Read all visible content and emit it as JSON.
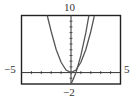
{
  "chart_data": {
    "type": "line",
    "title": "",
    "xlabel": "",
    "ylabel": "",
    "xlim": [
      -5,
      5
    ],
    "ylim": [
      -2,
      10
    ],
    "grid": false,
    "x_ticks_every": 1,
    "y_ticks_every": 1,
    "window_labels": {
      "xmin": "−5",
      "xmax": "5",
      "ymin": "−2",
      "ymax": "10"
    },
    "series": [
      {
        "name": "curve-1",
        "description": "wide parabola, vertex at origin",
        "x": [
          -2.4,
          -2,
          -1.5,
          -1,
          -0.5,
          0,
          0.5,
          1,
          1.5,
          2,
          2.35
        ],
        "y": [
          10,
          7.2,
          4.05,
          1.8,
          0.45,
          0,
          0.45,
          1.8,
          4.05,
          7.2,
          9.9
        ]
      },
      {
        "name": "curve-2",
        "description": "steeper curve rising from below y=-2 near x=0",
        "x": [
          -0.05,
          0,
          0.25,
          0.5,
          1,
          1.5,
          1.9
        ],
        "y": [
          -2.2,
          -2,
          -1.1,
          0,
          3,
          7,
          10.9
        ]
      }
    ]
  }
}
